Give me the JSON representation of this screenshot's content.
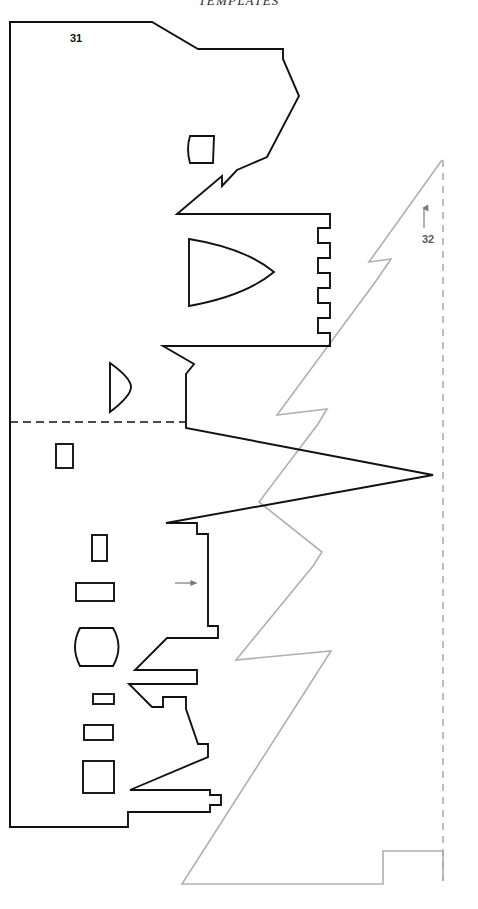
{
  "header": {
    "title": "TEMPLATES"
  },
  "figure": {
    "name": "template-cutting-diagram",
    "colors": {
      "outline_black": "#111111",
      "outline_gray": "#b0b0b0",
      "dashed_black": "#111111",
      "dashed_gray": "#a8a8a8",
      "background": "#ffffff",
      "arrow_gray": "#7a7a7a"
    },
    "labels": [
      {
        "id": "label-31",
        "text": "31",
        "x": 76,
        "y": 42,
        "style": "black",
        "refers_to": "black-template-fold-line"
      },
      {
        "id": "label-32",
        "text": "32",
        "x": 428,
        "y": 243,
        "style": "gray",
        "refers_to": "gray-template-edge-line"
      }
    ],
    "leader_arrows": [
      {
        "id": "arrow-32-up",
        "direction": "up",
        "x": 424,
        "y_from": 228,
        "y_to": 207,
        "color": "#7a7a7a"
      },
      {
        "id": "arrow-interior-right",
        "direction": "right",
        "y": 583,
        "x_from": 175,
        "x_to": 196,
        "color": "#7a7a7a"
      }
    ],
    "reference_lines": [
      {
        "id": "top-fold-line",
        "orientation": "horizontal",
        "style": "dashed",
        "color": "#111111",
        "x1": 10,
        "y1": 22,
        "x2": 152,
        "y2": 22
      },
      {
        "id": "mid-fold-line",
        "orientation": "horizontal",
        "style": "dashed",
        "color": "#111111",
        "x1": 10,
        "y1": 422,
        "x2": 186,
        "y2": 422
      },
      {
        "id": "right-edge-line",
        "orientation": "vertical",
        "style": "dashed",
        "color": "#a8a8a8",
        "x1": 443,
        "y1": 160,
        "x2": 443,
        "y2": 881
      }
    ],
    "cutouts": [
      {
        "id": "cutout-small-quad-top",
        "shape": "rounded-quad",
        "x": 186,
        "y": 134,
        "w": 29,
        "h": 30
      },
      {
        "id": "cutout-leaf-large",
        "shape": "pointed-oval",
        "x": 188,
        "y": 238,
        "w": 86,
        "h": 68
      },
      {
        "id": "cutout-half-disc",
        "shape": "half-disc",
        "x": 108,
        "y": 362,
        "w": 20,
        "h": 50
      },
      {
        "id": "cutout-rect-1",
        "shape": "rect",
        "x": 55,
        "y": 443,
        "w": 18,
        "h": 25
      },
      {
        "id": "cutout-rect-2",
        "shape": "rect",
        "x": 91,
        "y": 534,
        "w": 16,
        "h": 27
      },
      {
        "id": "cutout-rect-3",
        "shape": "rect",
        "x": 75,
        "y": 582,
        "w": 39,
        "h": 19
      },
      {
        "id": "cutout-barrel",
        "shape": "barrel",
        "x": 74,
        "y": 626,
        "w": 46,
        "h": 42
      },
      {
        "id": "cutout-rect-4",
        "shape": "rect",
        "x": 92,
        "y": 693,
        "w": 22,
        "h": 11
      },
      {
        "id": "cutout-rect-5",
        "shape": "rect",
        "x": 83,
        "y": 724,
        "w": 30,
        "h": 16
      },
      {
        "id": "cutout-rect-6",
        "shape": "rect",
        "x": 82,
        "y": 760,
        "w": 32,
        "h": 33
      }
    ],
    "black_template_outline": "M 10,22 L 10,827 L 128,827 L 128,812 L 210,812 L 210,805 L 221,805 L 221,795 L 210,795 L 210,790 L 130,790 L 208,757 L 208,744 L 198,744 L 186,709 L 186,697 L 163,697 L 163,707 L 152,707 L 129,684 L 197,684 L 197,670 L 135,670 L 167,638 L 218,638 L 218,626 L 208,626 L 208,534 L 197,534 L 197,523 L 166,523 L 433,475 L 186,428 L 186,374 L 194,364 L 163,346 L 330,346 L 330,333 L 318,333 L 318,318 L 330,318 L 330,303 L 318,303 L 318,288 L 330,288 L 330,273 L 318,273 L 318,258 L 330,258 L 330,243 L 318,243 L 318,228 L 330,228 L 330,214 L 177,214 L 222,176 L 222,186 L 237,170 L 267,157 L 299,96 L 283,59 L 283,49 L 198,49 L 152,22 Z",
    "gray_template_outline": "M 442,160 L 369,262 L 391,259 L 376,281 L 277,415 L 327,409 L 318,424 L 259,502 L 322,552 L 313,566 L 236,660 L 331,651 L 317,673 L 182,884 L 383,884 L 383,851 L 443,851 L 443,881"
  }
}
